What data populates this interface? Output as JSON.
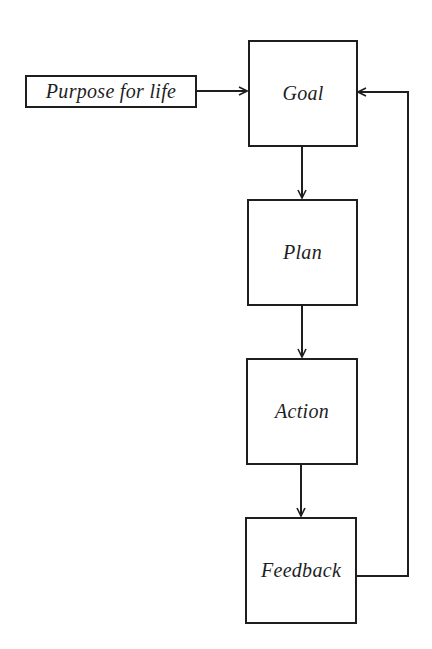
{
  "diagram": {
    "type": "flowchart",
    "nodes": [
      {
        "id": "purpose",
        "label": "Purpose for life"
      },
      {
        "id": "goal",
        "label": "Goal"
      },
      {
        "id": "plan",
        "label": "Plan"
      },
      {
        "id": "action",
        "label": "Action"
      },
      {
        "id": "feedback",
        "label": "Feedback"
      }
    ],
    "edges": [
      {
        "from": "purpose",
        "to": "goal"
      },
      {
        "from": "goal",
        "to": "plan"
      },
      {
        "from": "plan",
        "to": "action"
      },
      {
        "from": "action",
        "to": "feedback"
      },
      {
        "from": "feedback",
        "to": "goal",
        "style": "loop-right"
      }
    ],
    "colors": {
      "stroke": "#1e1e1e",
      "background": "#ffffff"
    }
  }
}
